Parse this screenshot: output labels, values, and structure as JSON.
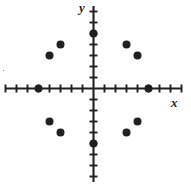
{
  "figure": {
    "name": "coordinate-plane-scatter",
    "width": 191,
    "height": 188,
    "background": "#ffffff",
    "ink_color": "#231f20"
  },
  "axes": {
    "x_label": "x",
    "y_label": "y",
    "origin_px": {
      "x": 93.5,
      "y": 88.5
    },
    "unit_px": 11.0,
    "x_range_units": [
      -8,
      8
    ],
    "y_range_units": [
      -8,
      8
    ],
    "x_axis_extent_px": {
      "x1": 5,
      "x2": 182
    },
    "y_axis_extent_px": {
      "y1": 6,
      "y2": 182
    },
    "tick_half_length_px": 4,
    "ticks_per_side": 8,
    "gridlines": false,
    "tick_labels_shown": false
  },
  "chart_data": {
    "type": "scatter",
    "title": "",
    "xlabel": "x",
    "ylabel": "y",
    "xlim": [
      -8,
      8
    ],
    "ylim": [
      -8,
      8
    ],
    "grid": false,
    "legend": "none",
    "marker": "filled-circle",
    "marker_radius_px": 4,
    "point_count": 12,
    "points": [
      {
        "id": "p-left-axis",
        "x": -5,
        "y": 0,
        "px": 38.5,
        "py": 88.5,
        "on_axis": "x"
      },
      {
        "id": "p-right-axis",
        "x": 5,
        "y": 0,
        "px": 148.5,
        "py": 88.5,
        "on_axis": "x"
      },
      {
        "id": "p-top-axis",
        "x": 0,
        "y": 5,
        "px": 93.5,
        "py": 33.5,
        "on_axis": "y"
      },
      {
        "id": "p-bottom-axis",
        "x": 0,
        "y": -5,
        "px": 93.5,
        "py": 143.5,
        "on_axis": "y"
      },
      {
        "id": "p-q2-outer",
        "x": -4,
        "y": 3,
        "px": 49.5,
        "py": 55.5,
        "on_axis": "none"
      },
      {
        "id": "p-q2-inner",
        "x": -3,
        "y": 4,
        "px": 60.5,
        "py": 44.5,
        "on_axis": "none"
      },
      {
        "id": "p-q1-inner",
        "x": 3,
        "y": 4,
        "px": 126.5,
        "py": 44.5,
        "on_axis": "none"
      },
      {
        "id": "p-q1-outer",
        "x": 4,
        "y": 3,
        "px": 137.5,
        "py": 55.5,
        "on_axis": "none"
      },
      {
        "id": "p-q3-outer",
        "x": -4,
        "y": -3,
        "px": 49.5,
        "py": 121.5,
        "on_axis": "none"
      },
      {
        "id": "p-q3-inner",
        "x": -3,
        "y": -4,
        "px": 60.5,
        "py": 132.5,
        "on_axis": "none"
      },
      {
        "id": "p-q4-inner",
        "x": 3,
        "y": -4,
        "px": 126.5,
        "py": 132.5,
        "on_axis": "none"
      },
      {
        "id": "p-q4-outer",
        "x": 4,
        "y": -3,
        "px": 137.5,
        "py": 121.5,
        "on_axis": "none"
      }
    ]
  }
}
